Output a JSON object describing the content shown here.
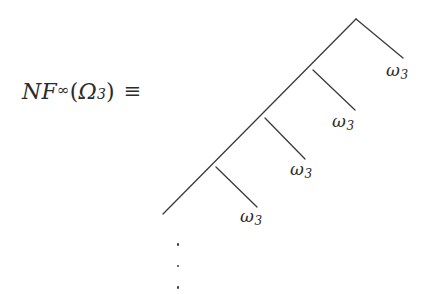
{
  "figure": {
    "background_color": "#ffffff",
    "ink_color": "#2b2b2b",
    "line_color": "#3a3a3a",
    "formula": {
      "fn_name": "NF",
      "superscript": "∞",
      "open_paren": "(",
      "argument": "Ω",
      "argument_subscript": "3",
      "close_paren": ")",
      "relation": "≡",
      "plain_text": "NF∞(Ω3) ≡"
    },
    "tree": {
      "description": "infinite right-spine binary tree",
      "root": {
        "x": 356,
        "y": 19
      },
      "spine_end": {
        "x": 163,
        "y": 214
      },
      "nodes": [
        {
          "id": "node-1",
          "x": 313,
          "y": 70
        },
        {
          "id": "node-2",
          "x": 265,
          "y": 118
        },
        {
          "id": "node-3",
          "x": 216,
          "y": 167
        }
      ],
      "leaves": [
        {
          "id": "leaf-1",
          "tip_x": 403,
          "tip_y": 58,
          "label": "ω",
          "subscript": "3",
          "label_x": 386,
          "label_y": 60
        },
        {
          "id": "leaf-2",
          "tip_x": 355,
          "tip_y": 110,
          "label": "ω",
          "subscript": "3",
          "label_x": 332,
          "label_y": 111
        },
        {
          "id": "leaf-3",
          "tip_x": 305,
          "tip_y": 159,
          "label": "ω",
          "subscript": "3",
          "label_x": 290,
          "label_y": 159
        },
        {
          "id": "leaf-4",
          "tip_x": 257,
          "tip_y": 207,
          "label": "ω",
          "subscript": "3",
          "label_x": 240,
          "label_y": 206
        }
      ]
    },
    "ellipsis": {
      "glyph": "⋮",
      "dot_count": 3,
      "x": 177,
      "y": 250
    }
  }
}
